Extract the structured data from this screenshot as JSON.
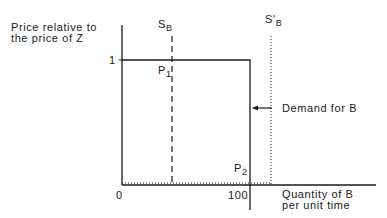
{
  "diagram": {
    "y_axis_label_line1": "Price relative to",
    "y_axis_label_line2": "the price of Z",
    "x_axis_label_line1": "Quantity of B",
    "x_axis_label_line2": "per unit time",
    "y_tick_1": "1",
    "x_tick_0": "0",
    "x_tick_100": "100",
    "supply_label": "S",
    "supply_sub": "B",
    "supply_shifted_label": "S'",
    "supply_shifted_sub": "B",
    "p1_label": "P",
    "p1_sub": "1",
    "p2_label": "P",
    "p2_sub": "2",
    "demand_label": "Demand for B",
    "line_color": "#1a1a1a"
  }
}
